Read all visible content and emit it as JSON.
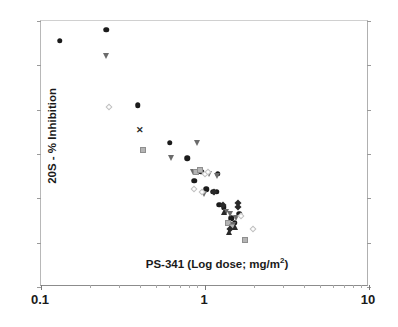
{
  "chart_data": {
    "type": "scatter",
    "title": "",
    "xlabel": "PS-341 (Log dose; mg/m2)",
    "xlabel_base": "PS-341 (Log dose; mg/m",
    "xlabel_sup": "2",
    "xlabel_tail": ")",
    "ylabel": "20S - % Inhibition",
    "xscale": "log",
    "xlim": [
      0.1,
      10
    ],
    "ylim": [
      0,
      120
    ],
    "grid": false,
    "legend": "none",
    "xticks_major": [
      {
        "value": 0.1,
        "label": "0.1"
      },
      {
        "value": 1,
        "label": "1"
      },
      {
        "value": 10,
        "label": "10"
      }
    ],
    "xticks_minor": [
      0.2,
      0.3,
      0.4,
      0.5,
      0.6,
      0.7,
      0.8,
      0.9,
      2,
      3,
      4,
      5,
      6,
      7,
      8,
      9
    ],
    "yticks": [
      0,
      20,
      40,
      60,
      80,
      100,
      120
    ],
    "ytick_labels": [
      "0",
      "20",
      "40",
      "60",
      "80",
      "100",
      "120"
    ],
    "series": [
      {
        "name": "black-circle",
        "marker": "circle",
        "color": "#1b1b1b",
        "points": [
          {
            "x": 0.13,
            "y": 111
          },
          {
            "x": 0.25,
            "y": 116
          },
          {
            "x": 0.39,
            "y": 82
          },
          {
            "x": 0.61,
            "y": 65
          },
          {
            "x": 0.78,
            "y": 58
          },
          {
            "x": 0.86,
            "y": 48
          },
          {
            "x": 0.95,
            "y": 52
          },
          {
            "x": 1.02,
            "y": 44
          },
          {
            "x": 1.12,
            "y": 43
          },
          {
            "x": 1.2,
            "y": 51
          },
          {
            "x": 1.18,
            "y": 43
          },
          {
            "x": 1.3,
            "y": 36
          },
          {
            "x": 1.45,
            "y": 31
          },
          {
            "x": 1.52,
            "y": 29
          },
          {
            "x": 1.62,
            "y": 33
          },
          {
            "x": 1.22,
            "y": 37
          }
        ]
      },
      {
        "name": "gray-triangle-down",
        "marker": "triangle-down",
        "color": "#6b6b6b",
        "points": [
          {
            "x": 0.25,
            "y": 104
          },
          {
            "x": 0.62,
            "y": 58
          },
          {
            "x": 0.9,
            "y": 65
          },
          {
            "x": 0.84,
            "y": 52
          },
          {
            "x": 1.06,
            "y": 51
          },
          {
            "x": 0.98,
            "y": 42
          },
          {
            "x": 1.18,
            "y": 50
          },
          {
            "x": 1.35,
            "y": 34
          },
          {
            "x": 1.42,
            "y": 33
          },
          {
            "x": 1.48,
            "y": 28
          },
          {
            "x": 1.55,
            "y": 31
          }
        ]
      },
      {
        "name": "gray-square",
        "marker": "square",
        "color": "#b4b4b4",
        "points": [
          {
            "x": 0.42,
            "y": 62
          },
          {
            "x": 0.88,
            "y": 52
          },
          {
            "x": 0.93,
            "y": 53
          },
          {
            "x": 1.38,
            "y": 29
          },
          {
            "x": 1.46,
            "y": 27
          },
          {
            "x": 1.75,
            "y": 21
          }
        ]
      },
      {
        "name": "open-diamond",
        "marker": "diamond-open",
        "color": "#c0c0c0",
        "points": [
          {
            "x": 0.26,
            "y": 81
          },
          {
            "x": 0.86,
            "y": 44
          },
          {
            "x": 1.0,
            "y": 51
          },
          {
            "x": 1.05,
            "y": 52
          },
          {
            "x": 0.96,
            "y": 43
          },
          {
            "x": 1.65,
            "y": 32
          },
          {
            "x": 1.95,
            "y": 26
          }
        ]
      },
      {
        "name": "dark-diamond",
        "marker": "diamond-filled",
        "color": "#2a2a2a",
        "points": [
          {
            "x": 1.14,
            "y": 43
          },
          {
            "x": 1.28,
            "y": 37
          },
          {
            "x": 1.58,
            "y": 38
          },
          {
            "x": 1.6,
            "y": 36
          },
          {
            "x": 1.42,
            "y": 26
          }
        ]
      },
      {
        "name": "dark-triangle-up",
        "marker": "triangle-up",
        "color": "#2a2a2a",
        "points": [
          {
            "x": 1.3,
            "y": 34
          },
          {
            "x": 1.4,
            "y": 25
          },
          {
            "x": 1.52,
            "y": 27
          }
        ]
      },
      {
        "name": "x-marker",
        "marker": "x",
        "color": "#2b2b2b",
        "points": [
          {
            "x": 0.4,
            "y": 71
          }
        ]
      }
    ]
  }
}
